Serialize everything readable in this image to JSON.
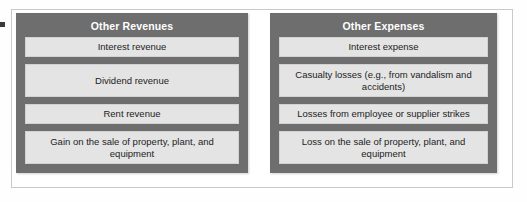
{
  "figure": {
    "panels": [
      {
        "id": "other-revenues",
        "title": "Other Revenues",
        "items": [
          {
            "text": "Interest revenue",
            "lines": 1
          },
          {
            "text": "Dividend revenue",
            "lines": 2
          },
          {
            "text": "Rent revenue",
            "lines": 1
          },
          {
            "text": "Gain on the sale of property, plant, and equipment",
            "lines": 2
          }
        ]
      },
      {
        "id": "other-expenses",
        "title": "Other Expenses",
        "items": [
          {
            "text": "Interest expense",
            "lines": 1
          },
          {
            "text": "Casualty losses (e.g., from vandalism and accidents)",
            "lines": 2
          },
          {
            "text": "Losses from employee or supplier strikes",
            "lines": 1
          },
          {
            "text": "Loss on the sale of property, plant, and equipment",
            "lines": 2
          }
        ]
      }
    ],
    "colors": {
      "panel_background": "#6e6e6e",
      "item_background": "#e4e4e4",
      "title_text": "#ffffff",
      "item_text": "#1c1c1c",
      "frame_border": "#c9c9c9",
      "page_background": "#ffffff"
    }
  }
}
